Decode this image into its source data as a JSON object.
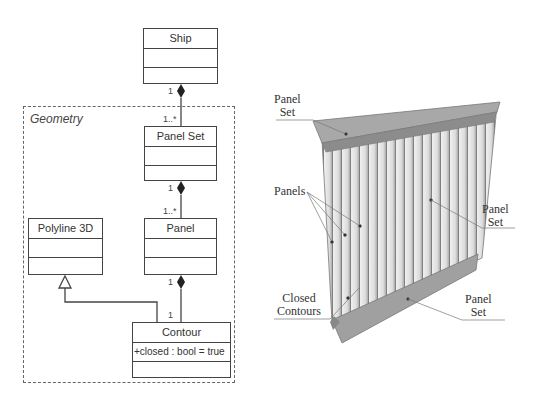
{
  "uml": {
    "package": {
      "label": "Geometry"
    },
    "classes": {
      "ship": {
        "name": "Ship"
      },
      "panel_set": {
        "name": "Panel Set"
      },
      "panel": {
        "name": "Panel"
      },
      "polyline3d": {
        "name": "Polyline 3D"
      },
      "contour": {
        "name": "Contour",
        "attribute": "+closed : bool = true"
      }
    },
    "multiplicities": {
      "ship_side": "1",
      "panel_set_from_ship": "1..*",
      "panel_set_side": "1",
      "panel_from_panel_set": "1..*",
      "panel_side": "1",
      "contour_from_panel": "1"
    },
    "relations": [
      {
        "type": "composition",
        "whole": "Ship",
        "part": "Panel Set"
      },
      {
        "type": "composition",
        "whole": "Panel Set",
        "part": "Panel"
      },
      {
        "type": "composition",
        "whole": "Panel",
        "part": "Contour"
      },
      {
        "type": "generalization",
        "child": "Contour",
        "parent": "Polyline 3D"
      }
    ]
  },
  "illustration": {
    "labels": {
      "panel_set_top": [
        "Panel",
        "Set"
      ],
      "panels": "Panels",
      "panel_set_right": [
        "Panel",
        "Set"
      ],
      "closed_contours": [
        "Closed",
        "Contours"
      ],
      "panel_set_bottom": [
        "Panel",
        "Set"
      ]
    },
    "colors": {
      "beam": "#9a9a9a",
      "panel_light": "#e6e6e6",
      "panel_dark": "#8a8a8a"
    }
  }
}
